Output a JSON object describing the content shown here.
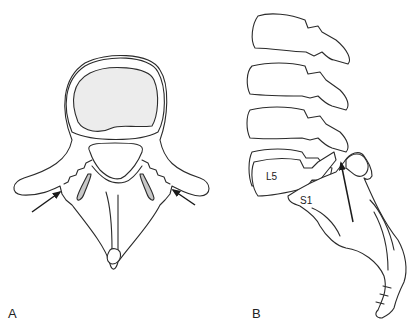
{
  "figure": {
    "panels": [
      {
        "id": "A",
        "label": "A",
        "description": "Axial view of lumbar vertebra with bilateral pars defects"
      },
      {
        "id": "B",
        "label": "B",
        "description": "Lateral view of lumbosacral spine showing L5 spondylolysis"
      }
    ],
    "vertebra_labels": {
      "l5": "L5",
      "s1": "S1"
    },
    "colors": {
      "line": "#2b2b2b",
      "disc_fill": "#ececec",
      "facet_fill": "#c8c8c8",
      "arrow": "#1a1a1a",
      "background": "#ffffff"
    }
  }
}
